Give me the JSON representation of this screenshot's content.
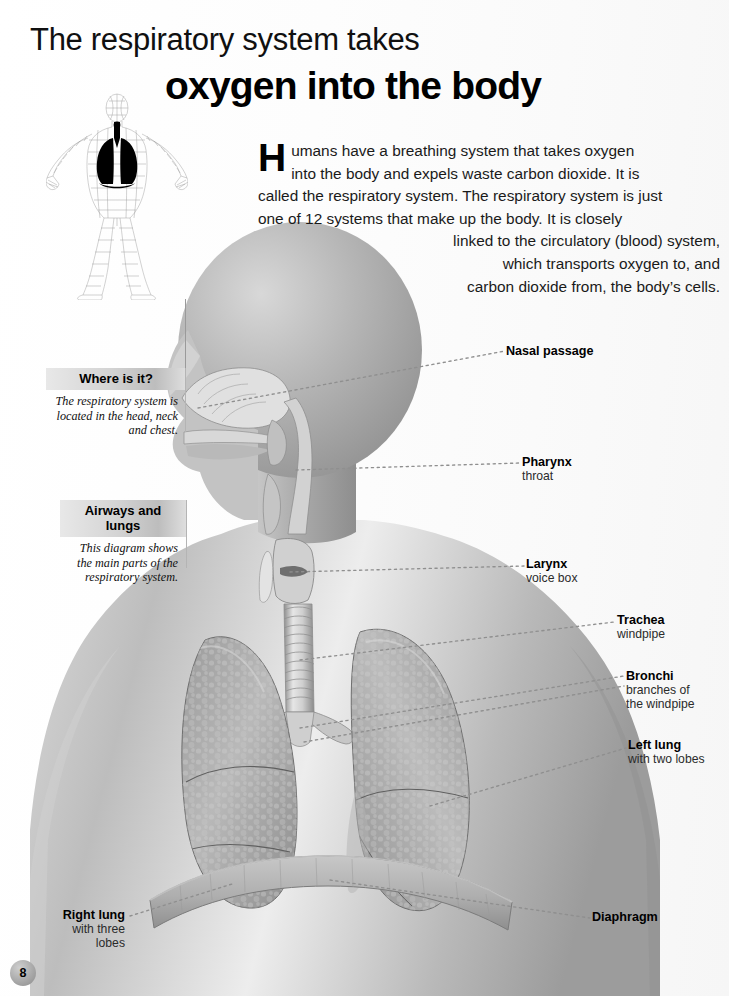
{
  "page": {
    "number": "8",
    "title_line1": "The respiratory system takes",
    "title_line2": "oxygen into the body"
  },
  "intro": {
    "dropcap": "H",
    "lines": [
      "umans have a breathing system that takes oxygen",
      "into the body and expels waste carbon dioxide. It is",
      "called the respiratory system. The respiratory system is just",
      "one of 12 systems that make up the body. It is closely",
      "linked to the circulatory (blood) system,",
      "which transports oxygen to, and",
      "carbon dioxide from, the body’s cells."
    ]
  },
  "callouts": [
    {
      "id": "where",
      "heading": "Where is it?",
      "body": "The respiratory system is located in the head, neck and chest."
    },
    {
      "id": "airways",
      "heading": "Airways and lungs",
      "body": "This diagram shows the main parts of the respiratory system."
    }
  ],
  "labels": {
    "nasal": {
      "title": "Nasal passage",
      "sub": ""
    },
    "pharynx": {
      "title": "Pharynx",
      "sub": "throat"
    },
    "larynx": {
      "title": "Larynx",
      "sub": "voice box"
    },
    "trachea": {
      "title": "Trachea",
      "sub": "windpipe"
    },
    "bronchi": {
      "title": "Bronchi",
      "sub": "branches of",
      "sub2": "the windpipe"
    },
    "left_lung": {
      "title": "Left lung",
      "sub": "with two lobes"
    },
    "right_lung": {
      "title": "Right lung",
      "sub": "with three",
      "sub2": "lobes"
    },
    "diaphragm": {
      "title": "Diaphragm",
      "sub": ""
    }
  },
  "colors": {
    "paper": "#ffffff",
    "ink": "#000000",
    "callout_header": "#c9c9c9",
    "leader_line": "#8f8f8f",
    "illustration_mid": "#a6a6a6",
    "illustration_dark": "#6f6f6f",
    "illustration_light": "#e4e4e4"
  }
}
